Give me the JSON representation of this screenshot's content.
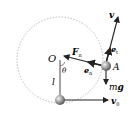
{
  "diagram": {
    "type": "pendulum-circular-motion",
    "labels": {
      "origin": "O",
      "angle": "θ",
      "length": "l",
      "point": "A",
      "velocity": "v",
      "tangent_unit": "e",
      "tangent_sub": "t",
      "normal_unit": "e",
      "normal_sub": "n",
      "normal_force": "F",
      "normal_force_sub": "n",
      "gravity": "mg",
      "initial_velocity": "v",
      "initial_velocity_sub": "0"
    },
    "colors": {
      "circle": "#aaaaaa",
      "line": "#222222",
      "ball": "#999999"
    }
  }
}
